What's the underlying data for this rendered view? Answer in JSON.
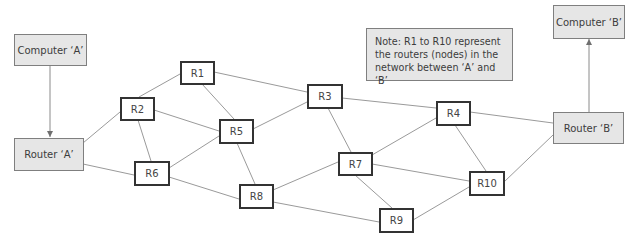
{
  "diagram": {
    "endpoints": {
      "computer_a": "Computer ‘A’",
      "router_a": "Router ‘A’",
      "computer_b": "Computer ‘B’",
      "router_b": "Router ‘B’"
    },
    "routers": {
      "r1": "R1",
      "r2": "R2",
      "r3": "R3",
      "r4": "R4",
      "r5": "R5",
      "r6": "R6",
      "r7": "R7",
      "r8": "R8",
      "r9": "R9",
      "r10": "R10"
    },
    "note": "Note: R1 to R10 represent the routers (nodes) in the network between ‘A’ and ‘B’",
    "arrows": [
      {
        "from": "Computer A",
        "to": "Router A"
      },
      {
        "from": "Router B",
        "to": "Computer B"
      }
    ],
    "links": [
      [
        "Router A",
        "R2"
      ],
      [
        "Router A",
        "R6"
      ],
      [
        "R2",
        "R1"
      ],
      [
        "R2",
        "R5"
      ],
      [
        "R2",
        "R6"
      ],
      [
        "R1",
        "R5"
      ],
      [
        "R1",
        "R3"
      ],
      [
        "R6",
        "R5"
      ],
      [
        "R6",
        "R8"
      ],
      [
        "R5",
        "R3"
      ],
      [
        "R5",
        "R8"
      ],
      [
        "R3",
        "R4"
      ],
      [
        "R3",
        "R7"
      ],
      [
        "R8",
        "R7"
      ],
      [
        "R8",
        "R9"
      ],
      [
        "R7",
        "R4"
      ],
      [
        "R7",
        "R10"
      ],
      [
        "R7",
        "R9"
      ],
      [
        "R4",
        "R10"
      ],
      [
        "R4",
        "Router B"
      ],
      [
        "R9",
        "R10"
      ],
      [
        "R10",
        "Router B"
      ]
    ],
    "colors": {
      "endpoint_fill": "#e6e6e6",
      "router_fill": "#ffffff",
      "router_border": "#333333",
      "link": "#9a9a9a"
    }
  }
}
